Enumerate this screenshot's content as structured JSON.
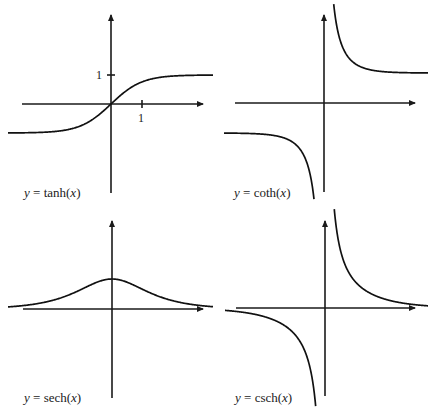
{
  "chart_data": [
    {
      "type": "line",
      "function": "tanh",
      "title": "",
      "annotation": {
        "prefix": "y",
        "eq": " = ",
        "fn": "tanh",
        "arg": "x"
      },
      "xlim": [
        -3.3,
        3.3
      ],
      "ylim": [
        -3.1,
        3.1
      ],
      "ticks": {
        "x": [
          {
            "value": 1,
            "label": "1"
          }
        ],
        "y": [
          {
            "value": 1,
            "label": "1"
          }
        ]
      },
      "asymptotes_y": [
        1,
        -1
      ],
      "grid": false,
      "legend": "none",
      "label_position": "bottom-left"
    },
    {
      "type": "line",
      "function": "coth",
      "title": "",
      "annotation": {
        "prefix": "y",
        "eq": " = ",
        "fn": "coth",
        "arg": "x"
      },
      "xlim": [
        -3.3,
        3.3
      ],
      "ylim": [
        -3.1,
        3.1
      ],
      "ticks": {
        "x": [],
        "y": []
      },
      "asymptotes_y": [
        1,
        -1
      ],
      "vertical_asymptote_x": 0,
      "grid": false,
      "legend": "none",
      "label_position": "bottom-left"
    },
    {
      "type": "line",
      "function": "sech",
      "title": "",
      "annotation": {
        "prefix": "y",
        "eq": " = ",
        "fn": "sech",
        "arg": "x"
      },
      "xlim": [
        -3.3,
        3.3
      ],
      "ylim": [
        -3.1,
        3.1
      ],
      "ticks": {
        "x": [],
        "y": []
      },
      "maximum": {
        "x": 0,
        "y": 1
      },
      "grid": false,
      "legend": "none",
      "label_position": "bottom-left"
    },
    {
      "type": "line",
      "function": "csch",
      "title": "",
      "annotation": {
        "prefix": "y",
        "eq": " = ",
        "fn": "csch",
        "arg": "x"
      },
      "xlim": [
        -3.3,
        3.3
      ],
      "ylim": [
        -3.1,
        3.1
      ],
      "ticks": {
        "x": [],
        "y": []
      },
      "vertical_asymptote_x": 0,
      "grid": false,
      "legend": "none",
      "label_position": "bottom-left"
    }
  ]
}
